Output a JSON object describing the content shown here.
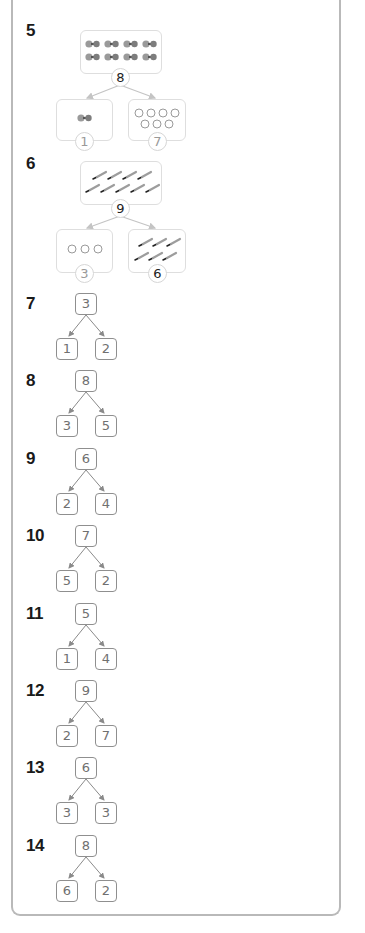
{
  "problems": [
    {
      "number": "5",
      "type": "picture-bond",
      "whole": {
        "value": "8",
        "status": "answer",
        "items": "dumbbell",
        "count": 8
      },
      "parts": [
        {
          "value": "1",
          "status": "given",
          "items": "dumbbell",
          "count": 1
        },
        {
          "value": "7",
          "status": "given",
          "items": "circle",
          "count": 7
        }
      ]
    },
    {
      "number": "6",
      "type": "picture-bond",
      "whole": {
        "value": "9",
        "status": "answer",
        "items": "pencil",
        "count": 9
      },
      "parts": [
        {
          "value": "3",
          "status": "given",
          "items": "circle",
          "count": 3
        },
        {
          "value": "6",
          "status": "answer",
          "items": "pencil",
          "count": 6
        }
      ]
    },
    {
      "number": "7",
      "type": "number-bond",
      "whole": "3",
      "parts": [
        "1",
        "2"
      ]
    },
    {
      "number": "8",
      "type": "number-bond",
      "whole": "8",
      "parts": [
        "3",
        "5"
      ]
    },
    {
      "number": "9",
      "type": "number-bond",
      "whole": "6",
      "parts": [
        "2",
        "4"
      ]
    },
    {
      "number": "10",
      "type": "number-bond",
      "whole": "7",
      "parts": [
        "5",
        "2"
      ]
    },
    {
      "number": "11",
      "type": "number-bond",
      "whole": "5",
      "parts": [
        "1",
        "4"
      ]
    },
    {
      "number": "12",
      "type": "number-bond",
      "whole": "9",
      "parts": [
        "2",
        "7"
      ]
    },
    {
      "number": "13",
      "type": "number-bond",
      "whole": "6",
      "parts": [
        "3",
        "3"
      ]
    },
    {
      "number": "14",
      "type": "number-bond",
      "whole": "8",
      "parts": [
        "6",
        "2"
      ]
    }
  ],
  "colors": {
    "panel_border": "#b9b9b9",
    "bond_border": "#8f8f8f",
    "bond_text": "#707070",
    "answer_text": "#222222",
    "given_text": "#9a9a9a"
  }
}
